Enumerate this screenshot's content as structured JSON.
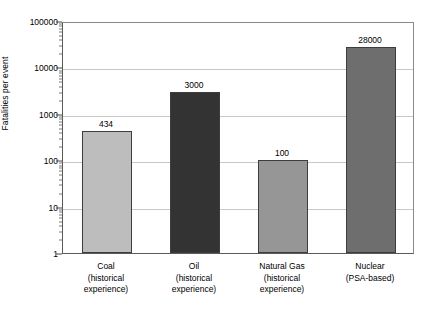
{
  "chart_data": {
    "type": "bar",
    "title": "",
    "xlabel": "",
    "ylabel": "Fatalities per event",
    "scale": "log",
    "ylim": [
      1,
      100000
    ],
    "grid": true,
    "legend": "none",
    "categories": [
      "Coal\n(historical\nexperience)",
      "Oil\n(historical\nexperience)",
      "Natural Gas\n(historical\nexperience)",
      "Nuclear\n(PSA-based)"
    ],
    "values": [
      434,
      3000,
      100,
      28000
    ],
    "value_labels": [
      "434",
      "3000",
      "100",
      "28000"
    ],
    "bar_colors": [
      "#bdbdbd",
      "#333333",
      "#969696",
      "#6e6e6e"
    ],
    "y_tick_labels": [
      "1",
      "10",
      "100",
      "1000",
      "10000",
      "100000"
    ],
    "y_tick_values": [
      1,
      10,
      100,
      1000,
      10000,
      100000
    ],
    "bars": [
      {
        "name": "coal",
        "label_line1": "Coal",
        "label_line2": "(historical",
        "label_line3": "experience)",
        "value": 434,
        "value_label": "434",
        "color": "#bdbdbd"
      },
      {
        "name": "oil",
        "label_line1": "Oil",
        "label_line2": "(historical",
        "label_line3": "experience)",
        "value": 3000,
        "value_label": "3000",
        "color": "#333333"
      },
      {
        "name": "natural-gas",
        "label_line1": "Natural Gas",
        "label_line2": "(historical",
        "label_line3": "experience)",
        "value": 100,
        "value_label": "100",
        "color": "#969696"
      },
      {
        "name": "nuclear",
        "label_line1": "Nuclear",
        "label_line2": "(PSA-based)",
        "label_line3": "",
        "value": 28000,
        "value_label": "28000",
        "color": "#6e6e6e"
      }
    ]
  }
}
